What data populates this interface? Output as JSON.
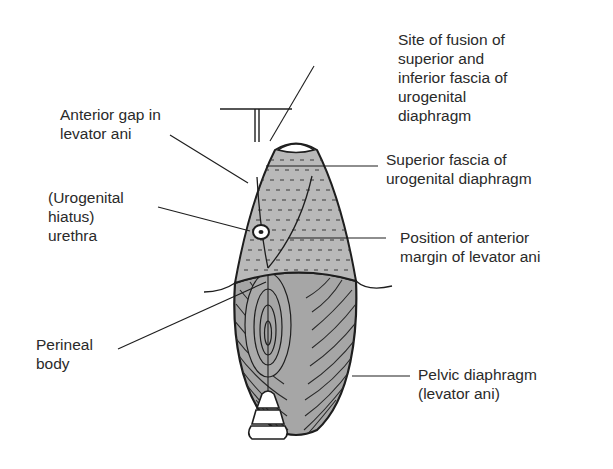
{
  "diagram": {
    "type": "anatomical-illustration",
    "colors": {
      "background": "#ffffff",
      "urogenital_fill": "#b9b9b9",
      "pelvic_fill": "#a6a6a6",
      "outline": "#1e1e1e",
      "text": "#2a2a2a"
    },
    "labels": {
      "site_of_fusion": {
        "lines": [
          "Site of fusion of",
          "superior and",
          "inferior fascia of",
          "urogenital",
          "diaphragm"
        ]
      },
      "anterior_gap": {
        "lines": [
          "Anterior gap in",
          "levator ani"
        ]
      },
      "superior_fascia": {
        "lines": [
          "Superior fascia of",
          "urogenital diaphragm"
        ]
      },
      "urethra": {
        "lines": [
          "(Urogenital",
          "hiatus)",
          "urethra"
        ]
      },
      "anterior_margin": {
        "lines": [
          "Position of anterior",
          "margin of levator ani"
        ]
      },
      "perineal_body": {
        "lines": [
          "Perineal",
          "body"
        ]
      },
      "pelvic_diaphragm": {
        "lines": [
          "Pelvic diaphragm",
          "(levator ani)"
        ]
      }
    }
  }
}
